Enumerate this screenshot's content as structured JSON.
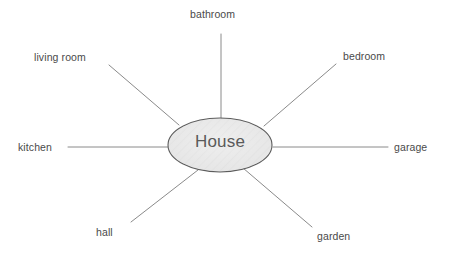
{
  "diagram": {
    "type": "mind-map",
    "title": "House",
    "center": {
      "label": "House",
      "shape": "ellipse",
      "cx": 220,
      "cy": 145,
      "rx": 52,
      "ry": 27,
      "fill": "#e9e9e9",
      "stroke": "#5d5d5d"
    },
    "style": {
      "background": "#ffffff",
      "line_color": "#8a8a8a",
      "label_color": "#4a4a4a",
      "center_label_color": "#5a5a5a"
    },
    "branches": [
      {
        "label": "bathroom",
        "direction": "top",
        "label_x": 190,
        "label_y": 8,
        "line": {
          "x1": 221,
          "y1": 34,
          "x2": 221,
          "y2": 119
        }
      },
      {
        "label": "bedroom",
        "direction": "upper-right",
        "label_x": 343,
        "label_y": 50,
        "line": {
          "x1": 336,
          "y1": 64,
          "x2": 264,
          "y2": 126
        }
      },
      {
        "label": "garage",
        "direction": "right",
        "label_x": 394,
        "label_y": 141,
        "line": {
          "x1": 388,
          "y1": 147,
          "x2": 273,
          "y2": 147
        }
      },
      {
        "label": "garden",
        "direction": "lower-right",
        "label_x": 317,
        "label_y": 230,
        "line": {
          "x1": 243,
          "y1": 168,
          "x2": 312,
          "y2": 227
        }
      },
      {
        "label": "hall",
        "direction": "lower-left",
        "label_x": 96,
        "label_y": 226,
        "line": {
          "x1": 198,
          "y1": 170,
          "x2": 131,
          "y2": 222
        }
      },
      {
        "label": "kitchen",
        "direction": "left",
        "label_x": 18,
        "label_y": 141,
        "line": {
          "x1": 68,
          "y1": 147,
          "x2": 168,
          "y2": 147
        }
      },
      {
        "label": "living room",
        "direction": "upper-left",
        "label_x": 34,
        "label_y": 51,
        "line": {
          "x1": 109,
          "y1": 65,
          "x2": 179,
          "y2": 125
        }
      }
    ]
  }
}
